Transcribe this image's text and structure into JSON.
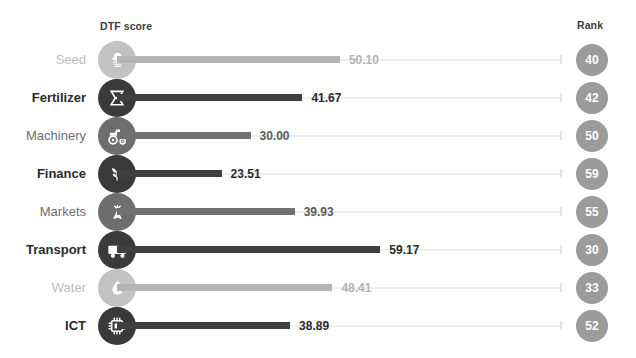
{
  "header": {
    "score_label": "DTF score",
    "rank_label": "Rank"
  },
  "colors": {
    "dark": "#3a3a3a",
    "mid": "#6e6e6e",
    "light": "#c2c2c2",
    "rank_badge": "#9b9b9b",
    "track": "#eeeeee",
    "background": "#ffffff"
  },
  "chart_data": {
    "type": "bar",
    "title": "",
    "subtitle": "",
    "xlabel": "DTF score",
    "ylabel": "",
    "orientation": "horizontal",
    "xlim": [
      0,
      100
    ],
    "grid": false,
    "legend": null,
    "categories": [
      "Seed",
      "Fertilizer",
      "Machinery",
      "Finance",
      "Markets",
      "Transport",
      "Water",
      "ICT"
    ],
    "values": [
      50.1,
      41.67,
      30.0,
      23.51,
      39.93,
      59.17,
      48.41,
      38.89
    ],
    "value_labels": [
      "50.10",
      "41.67",
      "30.00",
      "23.51",
      "39.93",
      "59.17",
      "48.41",
      "38.89"
    ],
    "ranks": [
      40,
      42,
      50,
      59,
      55,
      30,
      33,
      52
    ],
    "emphasis": [
      "light",
      "dark",
      "mid",
      "dark",
      "mid",
      "dark",
      "light",
      "dark"
    ],
    "icons": [
      "seed-icon",
      "fertilizer-icon",
      "tractor-icon",
      "finance-plant-icon",
      "carrot-icon",
      "truck-icon",
      "water-drop-icon",
      "microchip-icon"
    ]
  },
  "rows": [
    {
      "label": "Seed",
      "value": "50.10",
      "rank": "40",
      "icon": "seed-icon",
      "tier": "light"
    },
    {
      "label": "Fertilizer",
      "value": "41.67",
      "rank": "42",
      "icon": "fertilizer-icon",
      "tier": "dark"
    },
    {
      "label": "Machinery",
      "value": "30.00",
      "rank": "50",
      "icon": "tractor-icon",
      "tier": "mid"
    },
    {
      "label": "Finance",
      "value": "23.51",
      "rank": "59",
      "icon": "finance-plant-icon",
      "tier": "dark"
    },
    {
      "label": "Markets",
      "value": "39.93",
      "rank": "55",
      "icon": "carrot-icon",
      "tier": "mid"
    },
    {
      "label": "Transport",
      "value": "59.17",
      "rank": "30",
      "icon": "truck-icon",
      "tier": "dark"
    },
    {
      "label": "Water",
      "value": "48.41",
      "rank": "33",
      "icon": "water-drop-icon",
      "tier": "light"
    },
    {
      "label": "ICT",
      "value": "38.89",
      "rank": "52",
      "icon": "microchip-icon",
      "tier": "dark"
    }
  ]
}
